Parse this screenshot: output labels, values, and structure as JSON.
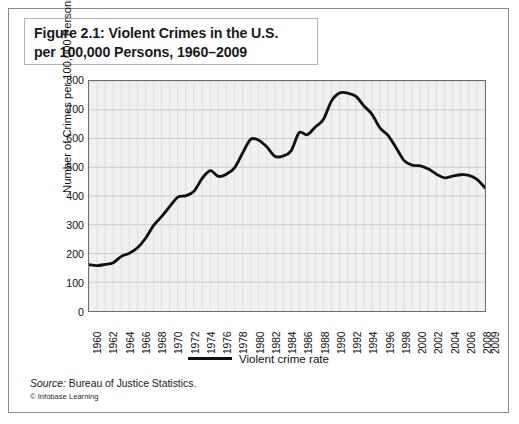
{
  "figure": {
    "title_line_1": "Figure 2.1: Violent Crimes in the U.S.",
    "title_line_2": "per 100,000 Persons, 1960–2009",
    "source_keyword": "Source:",
    "source_text": " Bureau of Justice Statistics.",
    "credit": "© Infobase Learning",
    "colors": {
      "line": "#111111",
      "plot_background": "#f1f1f1",
      "grid": "#d8d8d8",
      "grid_major": "#c9c9c9",
      "frame": "#6e6e6e",
      "outer_frame": "#8d8d8d",
      "text": "#111111",
      "page_background": "#ffffff"
    }
  },
  "legend": {
    "position": "bottom-center",
    "entries": [
      {
        "label": "Violent crime rate",
        "color": "#111111",
        "marker": "line"
      }
    ]
  },
  "chart_data": {
    "type": "line",
    "title": "Figure 2.1: Violent Crimes in the U.S. per 100,000 Persons, 1960–2009",
    "subtitle": "",
    "xlabel": "",
    "ylabel": "Number of Crimes per 100,000 Persons",
    "xlim": [
      1960,
      2009
    ],
    "ylim": [
      0,
      800
    ],
    "y_ticks": [
      0,
      100,
      200,
      300,
      400,
      500,
      600,
      700,
      800
    ],
    "y_tick_labels": [
      "0",
      "100",
      "200",
      "300",
      "400",
      "500",
      "600",
      "700",
      "800"
    ],
    "x_ticks": [
      1960,
      1962,
      1964,
      1966,
      1968,
      1970,
      1972,
      1974,
      1976,
      1978,
      1980,
      1982,
      1984,
      1986,
      1988,
      1990,
      1992,
      1994,
      1996,
      1998,
      2000,
      2002,
      2004,
      2006,
      2008,
      2009
    ],
    "x_tick_labels": [
      "1960",
      "1962",
      "1964",
      "1966",
      "1968",
      "1970",
      "1972",
      "1974",
      "1976",
      "1978",
      "1980",
      "1982",
      "1984",
      "1986",
      "1988",
      "1990",
      "1992",
      "1994",
      "1996",
      "1998",
      "2000",
      "2002",
      "2004",
      "2006",
      "2008",
      "2009"
    ],
    "grid": true,
    "grid_minor_x": "every year",
    "legend_position": "bottom-center",
    "series": [
      {
        "name": "Violent crime rate",
        "color": "#111111",
        "x": [
          1960,
          1961,
          1962,
          1963,
          1964,
          1965,
          1966,
          1967,
          1968,
          1969,
          1970,
          1971,
          1972,
          1973,
          1974,
          1975,
          1976,
          1977,
          1978,
          1979,
          1980,
          1981,
          1982,
          1983,
          1984,
          1985,
          1986,
          1987,
          1988,
          1989,
          1990,
          1991,
          1992,
          1993,
          1994,
          1995,
          1996,
          1997,
          1998,
          1999,
          2000,
          2001,
          2002,
          2003,
          2004,
          2005,
          2006,
          2007,
          2008,
          2009
        ],
        "values": [
          161,
          158,
          162,
          168,
          190,
          201,
          220,
          253,
          298,
          329,
          364,
          396,
          401,
          417,
          461,
          488,
          468,
          476,
          498,
          549,
          597,
          594,
          571,
          538,
          539,
          557,
          620,
          613,
          640,
          666,
          730,
          758,
          758,
          747,
          714,
          685,
          637,
          611,
          568,
          523,
          507,
          505,
          494,
          476,
          463,
          469,
          474,
          472,
          458,
          429
        ]
      }
    ],
    "annotations": {
      "peak": {
        "years": "1991–1992",
        "value": 758
      },
      "start": {
        "year": 1960,
        "value": 161
      },
      "end": {
        "year": 2009,
        "value": 429
      }
    }
  }
}
